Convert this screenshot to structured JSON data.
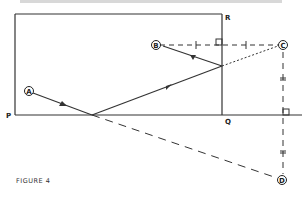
{
  "figure": {
    "caption": "FIGURE 4",
    "corner_labels": {
      "P": "P",
      "Q": "Q",
      "R": "R"
    },
    "points": {
      "A": "A",
      "B": "B",
      "C": "C",
      "D": "D"
    },
    "colors": {
      "ink": "#333333",
      "background": "#ffffff"
    }
  }
}
